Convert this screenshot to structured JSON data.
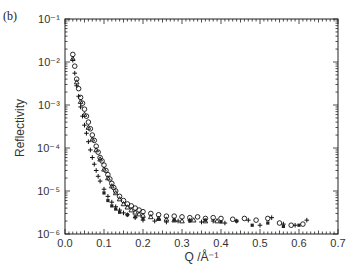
{
  "panel_label": "(b)",
  "chart_data": {
    "type": "scatter",
    "title": "",
    "xlabel": "Q /Å⁻¹",
    "ylabel": "Reflectivity",
    "xlim": [
      0.0,
      0.7
    ],
    "ylim": [
      1e-06,
      0.1
    ],
    "yscale": "log",
    "grid": false,
    "legend": null,
    "x_ticks": [
      "0.0",
      "0.1",
      "0.2",
      "0.3",
      "0.4",
      "0.5",
      "0.6",
      "0.7"
    ],
    "y_ticks": [
      "10⁻⁶",
      "10⁻⁵",
      "10⁻⁴",
      "10⁻³",
      "10⁻²",
      "10⁻¹"
    ],
    "series": [
      {
        "name": "circles",
        "marker": "o",
        "x": [
          0.02,
          0.025,
          0.03,
          0.035,
          0.04,
          0.045,
          0.05,
          0.055,
          0.06,
          0.065,
          0.07,
          0.075,
          0.08,
          0.085,
          0.09,
          0.095,
          0.1,
          0.105,
          0.11,
          0.115,
          0.12,
          0.125,
          0.13,
          0.14,
          0.15,
          0.16,
          0.17,
          0.18,
          0.19,
          0.2,
          0.22,
          0.24,
          0.26,
          0.28,
          0.3,
          0.32,
          0.34,
          0.36,
          0.38,
          0.4,
          0.43,
          0.46,
          0.49,
          0.52,
          0.55,
          0.58,
          0.61
        ],
        "y": [
          0.015,
          0.008,
          0.004,
          0.0024,
          0.0015,
          0.0011,
          0.0008,
          0.00055,
          0.0004,
          0.00028,
          0.0002,
          0.00015,
          0.00011,
          8e-05,
          6e-05,
          5e-05,
          4e-05,
          3e-05,
          2.4e-05,
          1.9e-05,
          1.5e-05,
          1.2e-05,
          1e-05,
          7.5e-06,
          6e-06,
          5e-06,
          4.5e-06,
          4e-06,
          3.6e-06,
          3.3e-06,
          3e-06,
          2.8e-06,
          2.6e-06,
          2.6e-06,
          2.5e-06,
          2.4e-06,
          2.5e-06,
          2.3e-06,
          2.4e-06,
          2.3e-06,
          2.2e-06,
          2.3e-06,
          2.1e-06,
          2.3e-06,
          1.8e-06,
          1.6e-06,
          1.7e-06
        ]
      },
      {
        "name": "triangles",
        "marker": "^",
        "x": [
          0.02,
          0.03,
          0.04,
          0.05,
          0.06,
          0.07,
          0.08,
          0.09,
          0.1,
          0.11,
          0.12,
          0.13,
          0.14,
          0.15,
          0.16,
          0.17,
          0.18,
          0.19,
          0.2,
          0.22,
          0.24,
          0.26,
          0.28,
          0.3,
          0.33,
          0.36,
          0.39
        ],
        "y": [
          0.012,
          0.0034,
          0.0012,
          0.0006,
          0.0003,
          0.00016,
          9e-05,
          5.5e-05,
          3.2e-05,
          2e-05,
          1.3e-05,
          9e-06,
          6.5e-06,
          5e-06,
          4.2e-06,
          3.6e-06,
          3.2e-06,
          2.9e-06,
          2.7e-06,
          2.5e-06,
          2.3e-06,
          2.2e-06,
          2.1e-06,
          2e-06,
          2.1e-06,
          2e-06,
          2e-06
        ]
      },
      {
        "name": "plus",
        "marker": "+",
        "x": [
          0.02,
          0.025,
          0.03,
          0.035,
          0.04,
          0.045,
          0.05,
          0.055,
          0.06,
          0.065,
          0.07,
          0.075,
          0.08,
          0.085,
          0.09,
          0.1,
          0.11,
          0.12,
          0.13,
          0.14,
          0.15,
          0.16,
          0.18,
          0.2,
          0.23,
          0.26,
          0.29,
          0.32,
          0.35,
          0.38,
          0.41,
          0.44,
          0.47,
          0.5,
          0.53,
          0.56,
          0.59,
          0.62
        ],
        "y": [
          0.011,
          0.0055,
          0.0028,
          0.0016,
          0.0009,
          0.00055,
          0.00034,
          0.00022,
          0.00014,
          9e-05,
          6e-05,
          4.2e-05,
          3e-05,
          2.2e-05,
          1.7e-05,
          1.1e-05,
          7.5e-06,
          5.5e-06,
          4.3e-06,
          3.6e-06,
          3.1e-06,
          2.8e-06,
          2.4e-06,
          2.1e-06,
          2e-06,
          1.9e-06,
          2e-06,
          2.1e-06,
          1.9e-06,
          2e-06,
          1.8e-06,
          2e-06,
          2.1e-06,
          1.6e-06,
          2.4e-06,
          1.7e-06,
          1.6e-06,
          2.1e-06
        ]
      },
      {
        "name": "filled",
        "marker": "*",
        "x": [
          0.1,
          0.11,
          0.12,
          0.13,
          0.14,
          0.16,
          0.18,
          0.2,
          0.24,
          0.28,
          0.32,
          0.36,
          0.4,
          0.44,
          0.48,
          0.52,
          0.56,
          0.6
        ],
        "y": [
          9e-06,
          6e-06,
          4.5e-06,
          3.8e-06,
          3.2e-06,
          2.8e-06,
          2.5e-06,
          2.3e-06,
          2.2e-06,
          2.1e-06,
          2e-06,
          2.1e-06,
          1.9e-06,
          2e-06,
          1.6e-06,
          1.8e-06,
          1.5e-06,
          1.6e-06
        ]
      }
    ]
  }
}
